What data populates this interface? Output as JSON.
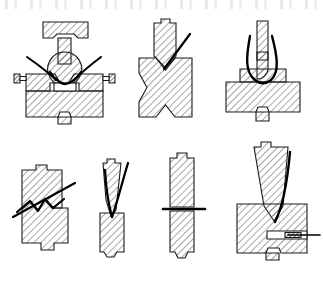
{
  "sheet": {
    "title": "Metal forming and cutting operations cross-section diagram",
    "background_color": "#ffffff",
    "outline_color": "#1a1a1a",
    "hatch_color": "#555555",
    "tool_line_color": "#000000",
    "width": 323,
    "height": 282,
    "top_artifact_label": "cut-off text row from preceding page",
    "rows": 2,
    "figure_count": 7
  },
  "figures": [
    {
      "id": "fig-1",
      "name": "ball-indenter-in-clamped-die",
      "row": 1,
      "column": 1,
      "caption": "Spherical punch with clamped split die and side bolts",
      "parts": [
        "top-platen",
        "punch-stem",
        "ball-workpiece",
        "split-die-block",
        "left-bolt",
        "right-bolt",
        "bottom-boss",
        "flow-lines"
      ]
    },
    {
      "id": "fig-2",
      "name": "v-punch-into-block",
      "row": 1,
      "column": 2,
      "caption": "V-shaped punch penetrating block forming X-section",
      "parts": [
        "v-punch",
        "x-shaped-block",
        "shear-line"
      ]
    },
    {
      "id": "fig-3",
      "name": "round-nose-punch-in-stepped-die",
      "row": 1,
      "column": 3,
      "caption": "Round-nose punch seated in stepped die with U-shaped flow boundary",
      "parts": [
        "punch-stem",
        "round-nose",
        "stepped-die",
        "u-flow-boundary",
        "bottom-boss"
      ]
    },
    {
      "id": "fig-4",
      "name": "offset-block-zigzag-shear",
      "row": 2,
      "column": 1,
      "caption": "Block pair separated by zigzag shear plane with diagonal slip line",
      "parts": [
        "upper-block",
        "lower-block",
        "zigzag-shear-line",
        "diagonal-slip-line",
        "top-boss",
        "bottom-boss"
      ]
    },
    {
      "id": "fig-5",
      "name": "wedge-punch-on-column",
      "row": 2,
      "column": 2,
      "caption": "Tapered wedge punch indenting narrow column",
      "parts": [
        "wedge-punch",
        "column-workpiece",
        "penetration-line"
      ]
    },
    {
      "id": "fig-6",
      "name": "column-horizontal-shear",
      "row": 2,
      "column": 3,
      "caption": "Vertical column divided by horizontal shear plane",
      "parts": [
        "upper-column",
        "lower-column",
        "horizontal-shear-line"
      ]
    },
    {
      "id": "fig-7",
      "name": "cone-punch-with-side-ejector",
      "row": 2,
      "column": 4,
      "caption": "Conical punch entering die block with lateral ejector pin",
      "parts": [
        "cone-punch",
        "die-block",
        "cone-flow-boundary",
        "side-ejector-pin",
        "ejector-channel",
        "bottom-boss"
      ]
    }
  ]
}
